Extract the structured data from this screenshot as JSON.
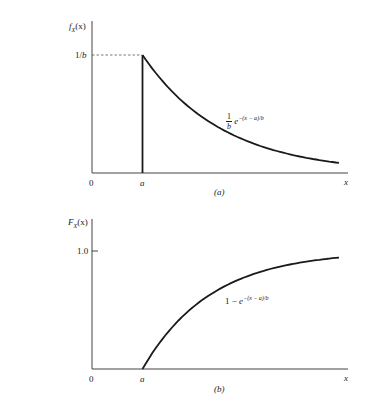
{
  "chart_data": [
    {
      "type": "line",
      "panel": "(a)",
      "title": "",
      "ylabel": "f_X(x)",
      "xlabel": "x",
      "x_ticks": [
        "0",
        "a"
      ],
      "y_ticks": [
        "1/b"
      ],
      "annotation": "(1/b) e^{-(x-a)/b}",
      "series": [
        {
          "name": "pdf",
          "description": "0 for x<a, vertical line at x=a up to 1/b, exponential decay afterwards",
          "x": [
            "a",
            "a+0.5b",
            "a+b",
            "a+1.5b",
            "a+2b",
            "a+2.5b"
          ],
          "values": [
            1.0,
            0.607,
            0.368,
            0.223,
            0.135,
            0.082
          ],
          "unit": "multiples of 1/b"
        }
      ],
      "dashed_guide": "horizontal dashed line from y-axis at 1/b to peak at x=a"
    },
    {
      "type": "line",
      "panel": "(b)",
      "title": "",
      "ylabel": "F_X(x)",
      "xlabel": "x",
      "x_ticks": [
        "0",
        "a"
      ],
      "y_ticks": [
        "1.0"
      ],
      "annotation": "1 - e^{-(x-a)/b}",
      "series": [
        {
          "name": "cdf",
          "description": "0 for x<a, rises toward 1.0 for x>a",
          "x": [
            "a",
            "a+0.5b",
            "a+b",
            "a+1.5b",
            "a+2b",
            "a+2.5b",
            "a+2.8b"
          ],
          "values": [
            0.0,
            0.393,
            0.632,
            0.777,
            0.865,
            0.918,
            0.939
          ]
        }
      ]
    }
  ],
  "panels": {
    "a": {
      "ylabel_main": "f",
      "ylabel_sub": "X",
      "ylabel_arg": "(x)",
      "ytick": "1/b",
      "xtick0": "0",
      "xticka": "a",
      "xend": "x",
      "caption": "(a)",
      "ann_num": "1",
      "ann_den": "b",
      "ann_base": "e",
      "ann_exp": "−(x − a)/b"
    },
    "b": {
      "ylabel_main": "F",
      "ylabel_sub": "X",
      "ylabel_arg": "(x)",
      "ytick": "1.0",
      "xtick0": "0",
      "xticka": "a",
      "xend": "x",
      "caption": "(b)",
      "ann_pre": "1 − ",
      "ann_base": "e",
      "ann_exp": "−(x − a)/b"
    }
  }
}
